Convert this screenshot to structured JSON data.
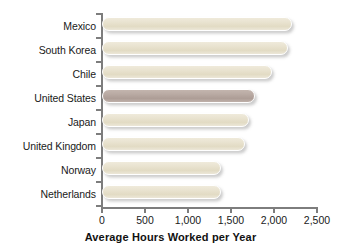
{
  "chart_data": {
    "type": "bar",
    "orientation": "horizontal",
    "title": "",
    "xlabel": "Average Hours Worked per Year",
    "ylabel": "",
    "xlim": [
      0,
      2500
    ],
    "grid": false,
    "legend": null,
    "categories": [
      "Mexico",
      "South Korea",
      "Chile",
      "United States",
      "Japan",
      "United Kingdom",
      "Norway",
      "Netherlands"
    ],
    "values": [
      2220,
      2170,
      1990,
      1790,
      1715,
      1670,
      1390,
      1390
    ],
    "highlight_index": 3,
    "xticks": [
      0,
      500,
      1000,
      1500,
      2000,
      2500
    ],
    "xtick_labels": [
      "0",
      "500",
      "1,000",
      "1,500",
      "2,000",
      "2,500"
    ],
    "colors": {
      "bar": "#e8e2cf",
      "bar_highlight": "#b8a9a2",
      "bar_outline": "#ffffff",
      "axis": "#7d7d7d",
      "text": "#1a1a1a",
      "background": "#ffffff"
    }
  }
}
